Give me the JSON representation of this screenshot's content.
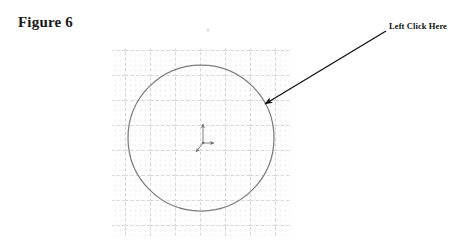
{
  "figure": {
    "caption": "Figure 6"
  },
  "annotation": {
    "label": "Left Click Here",
    "arrow": {
      "start_x": 386,
      "start_y": 31,
      "end_x": 262,
      "end_y": 106,
      "color": "#111111"
    }
  },
  "canvas": {
    "background_color": "#ffffff",
    "grid": {
      "left": 112,
      "top": 48,
      "width": 178,
      "height": 188,
      "minor_spacing": 5,
      "major_spacing": 25,
      "minor_color": "#c9c9c9",
      "major_color": "#969696",
      "style": "dotted-minor-dashed-major"
    },
    "circle": {
      "center_x": 201,
      "center_y": 138,
      "radius": 73,
      "stroke_color": "#7d7d7d",
      "stroke_width": 1.2,
      "fill": "none"
    },
    "origin_triad": {
      "origin_x": 203,
      "origin_y": 143,
      "color": "#6e6e6e",
      "axes": [
        {
          "name": "y-axis",
          "direction": "up",
          "length": 20
        },
        {
          "name": "x-axis",
          "direction": "right",
          "length": 12
        },
        {
          "name": "z-axis",
          "direction": "down-left",
          "length": 11
        }
      ]
    },
    "stray_mark": {
      "x": 208,
      "y": 30,
      "color": "#d8d8d8"
    }
  }
}
